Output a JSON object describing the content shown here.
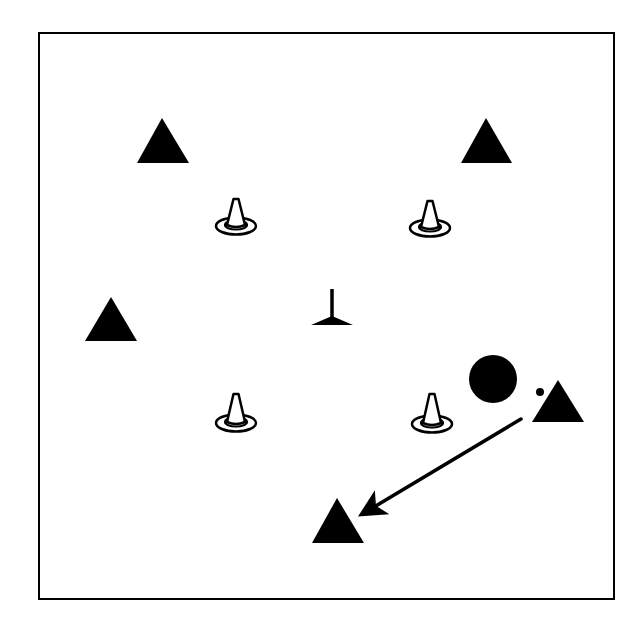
{
  "diagram": {
    "type": "sports-drill",
    "width": 643,
    "height": 639,
    "background": "#ffffff",
    "ink_color": "#000000",
    "field": {
      "x": 39,
      "y": 33,
      "width": 575,
      "height": 566,
      "stroke_width": 2
    },
    "players": [
      {
        "id": "player-top-left",
        "apex": [
          162,
          118
        ],
        "base_left": [
          137,
          163
        ],
        "base_right": [
          189,
          163
        ]
      },
      {
        "id": "player-top-right",
        "apex": [
          486,
          118
        ],
        "base_left": [
          461,
          163
        ],
        "base_right": [
          512,
          163
        ]
      },
      {
        "id": "player-left",
        "apex": [
          111,
          297
        ],
        "base_left": [
          85,
          341
        ],
        "base_right": [
          137,
          341
        ]
      },
      {
        "id": "player-right",
        "apex": [
          558,
          380
        ],
        "base_left": [
          532,
          422
        ],
        "base_right": [
          584,
          422
        ]
      },
      {
        "id": "player-bottom",
        "apex": [
          337,
          498
        ],
        "base_left": [
          312,
          543
        ],
        "base_right": [
          364,
          543
        ]
      }
    ],
    "cones": [
      {
        "id": "cone-top-left",
        "cx": 236,
        "apex_y": 199,
        "ring_y": 226
      },
      {
        "id": "cone-top-right",
        "cx": 430,
        "apex_y": 201,
        "ring_y": 228
      },
      {
        "id": "cone-bottom-left",
        "cx": 236,
        "apex_y": 394,
        "ring_y": 423
      },
      {
        "id": "cone-bottom-right",
        "cx": 432,
        "apex_y": 394,
        "ring_y": 424
      }
    ],
    "coach_marker": {
      "id": "center-marker",
      "stem_top": [
        332,
        289
      ],
      "stem_bottom": [
        332,
        319
      ],
      "base_left": [
        311,
        325
      ],
      "base_right": [
        353,
        325
      ]
    },
    "defender": {
      "id": "defender-circle",
      "cx": 493,
      "cy": 379,
      "r": 24
    },
    "ball": {
      "id": "ball",
      "cx": 540,
      "cy": 392,
      "r": 4
    },
    "pass_arrow": {
      "id": "pass-arrow",
      "from": [
        521,
        419
      ],
      "to": [
        364,
        513
      ],
      "stroke_width": 3.5
    }
  }
}
